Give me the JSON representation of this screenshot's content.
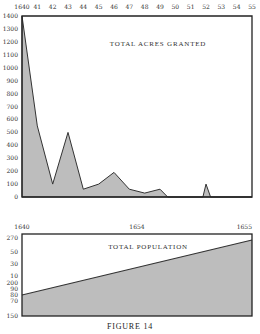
{
  "chart_data": [
    {
      "type": "area",
      "title": "TOTAL ACRES GRANTED",
      "xlabel": "",
      "ylabel": "",
      "x_tick_labels": [
        "1640",
        "41",
        "42",
        "43",
        "44",
        "45",
        "46",
        "47",
        "48",
        "49",
        "50",
        "51",
        "52",
        "53",
        "54",
        "55"
      ],
      "x": [
        1640,
        1641,
        1642,
        1643,
        1644,
        1645,
        1646,
        1647,
        1648,
        1649,
        1649.5,
        1651.8,
        1652,
        1652.3,
        1655
      ],
      "values": [
        1400,
        550,
        100,
        500,
        60,
        100,
        190,
        60,
        30,
        60,
        0,
        0,
        100,
        0,
        0
      ],
      "y_tick_labels": [
        "0",
        "100",
        "200",
        "300",
        "400",
        "500",
        "600",
        "700",
        "800",
        "900",
        "1000",
        "1100",
        "1200",
        "1300",
        "1400"
      ],
      "ylim": [
        0,
        1400
      ],
      "xlim": [
        1640,
        1655
      ],
      "grid": false,
      "legend": null
    },
    {
      "type": "area",
      "title": "TOTAL POPULATION",
      "xlabel": "",
      "ylabel": "",
      "x_tick_labels": [
        "1640",
        "1654",
        "1655"
      ],
      "x": [
        1640,
        1655
      ],
      "values": [
        80,
        270
      ],
      "y_tick_labels": [
        "270",
        "50",
        "30",
        "10",
        "200",
        "90",
        "80",
        "70",
        "150"
      ],
      "grid": false,
      "legend": null
    }
  ],
  "figure": {
    "caption": "FIGURE 14"
  },
  "top_chart": {
    "title": "TOTAL ACRES GRANTED",
    "x_ticks": [
      "1640",
      "41",
      "42",
      "43",
      "44",
      "45",
      "46",
      "47",
      "48",
      "49",
      "50",
      "51",
      "52",
      "53",
      "54",
      "55"
    ],
    "y_ticks": [
      "1400",
      "1300",
      "1200",
      "1100",
      "1000",
      "900",
      "800",
      "700",
      "600",
      "500",
      "400",
      "300",
      "200",
      "100",
      "0"
    ]
  },
  "bottom_chart": {
    "title": "TOTAL POPULATION",
    "x_ticks": [
      "1640",
      "1654",
      "1655"
    ],
    "y_ticks": [
      "270",
      "50",
      "30",
      "10",
      "200",
      "90",
      "80",
      "70",
      "150"
    ]
  },
  "colors": {
    "fill": "#bdbdbd",
    "line": "#333333",
    "axis": "#222222"
  }
}
